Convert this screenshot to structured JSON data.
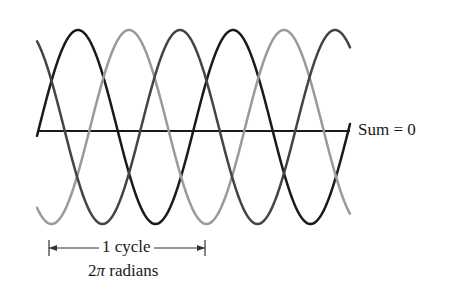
{
  "figure": {
    "sum_label": "Sum = 0",
    "cycle_label": "1 cycle",
    "radians_prefix": "2",
    "radians_symbol": "π",
    "radians_suffix": " radians"
  },
  "waves": {
    "x_start": 37,
    "x_end": 350,
    "period_px": 155,
    "center_y": 127,
    "amplitude_px": 97,
    "axis_y": 131,
    "stroke_width": 2.5,
    "series": [
      {
        "name": "phase-a",
        "color": "#1a1a1a",
        "peak_x": 78
      },
      {
        "name": "phase-b",
        "color": "#9a9a9a",
        "peak_x": 129
      },
      {
        "name": "phase-c",
        "color": "#444444",
        "peak_x": 180
      }
    ]
  },
  "dimension": {
    "x1": 49,
    "x2": 205,
    "y": 248,
    "color": "#333333"
  }
}
